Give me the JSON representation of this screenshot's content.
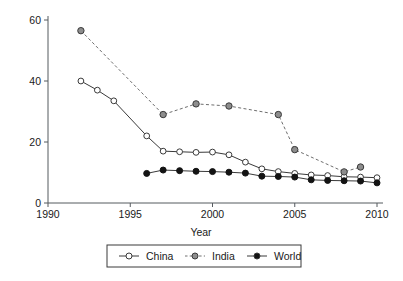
{
  "chart_data": {
    "type": "line",
    "title": "",
    "xlabel": "Year",
    "ylabel": "",
    "xlim": [
      1990,
      2010
    ],
    "ylim": [
      0,
      60
    ],
    "xticks": [
      1990,
      1995,
      2000,
      2005,
      2010
    ],
    "yticks": [
      0,
      20,
      40,
      60
    ],
    "xtick_labels": [
      "1990",
      "1995",
      "2000",
      "2005",
      "2010"
    ],
    "ytick_labels": [
      "0",
      "20",
      "40",
      "60"
    ],
    "grid": false,
    "legend_position": "below-axes",
    "series": [
      {
        "name": "China",
        "marker": "open-circle",
        "linestyle": "solid",
        "color": "#3a3a3a",
        "x": [
          1992,
          1993,
          1994,
          1996,
          1997,
          1998,
          1999,
          2000,
          2001,
          2002,
          2003,
          2004,
          2005,
          2006,
          2007,
          2008,
          2009,
          2010
        ],
        "y": [
          40.0,
          37.0,
          33.5,
          22.0,
          17.0,
          16.8,
          16.6,
          16.7,
          15.8,
          13.4,
          11.2,
          10.3,
          9.7,
          9.2,
          9.0,
          8.6,
          8.5,
          8.3
        ]
      },
      {
        "name": "India",
        "marker": "filled-gray-circle",
        "linestyle": "dotted",
        "color": "#6e6e6e",
        "x": [
          1992,
          1997,
          1999,
          2001,
          2004,
          2005,
          2008,
          2009
        ],
        "y": [
          56.5,
          29.0,
          32.5,
          31.8,
          29.0,
          17.5,
          10.2,
          11.8
        ]
      },
      {
        "name": "World",
        "marker": "filled-black-circle",
        "linestyle": "solid",
        "color": "#131313",
        "x": [
          1996,
          1997,
          1998,
          1999,
          2000,
          2001,
          2002,
          2003,
          2004,
          2005,
          2006,
          2007,
          2008,
          2009,
          2010
        ],
        "y": [
          9.7,
          10.8,
          10.6,
          10.4,
          10.3,
          10.1,
          9.8,
          8.8,
          8.7,
          8.5,
          7.6,
          7.4,
          7.3,
          7.2,
          6.6
        ]
      }
    ],
    "legend": [
      {
        "label": "China",
        "marker": "open-circle",
        "linestyle": "solid"
      },
      {
        "label": "India",
        "marker": "filled-gray-circle",
        "linestyle": "dotted"
      },
      {
        "label": "World",
        "marker": "filled-black-circle",
        "linestyle": "solid"
      }
    ]
  }
}
